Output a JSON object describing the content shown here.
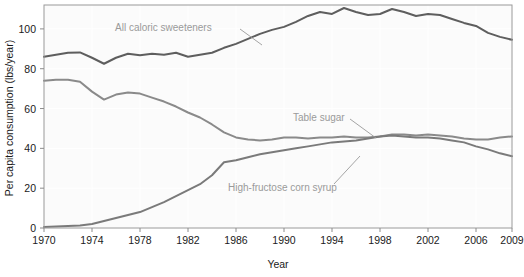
{
  "chart_data": {
    "type": "line",
    "title": "",
    "xlabel": "Year",
    "ylabel": "Per capita consumption (lbs/year)",
    "xlim": [
      1970,
      2009
    ],
    "ylim": [
      0,
      112
    ],
    "grid": true,
    "legend_position": "inline-annotations",
    "xticks": [
      1970,
      1974,
      1978,
      1982,
      1986,
      1990,
      1994,
      1998,
      2002,
      2006,
      2009
    ],
    "xtick_labels": [
      "1970",
      "1974",
      "1978",
      "1982",
      "1986",
      "1990",
      "1994",
      "1998",
      "2002",
      "2006",
      "2009"
    ],
    "yticks": [
      0,
      20,
      40,
      60,
      80,
      100
    ],
    "ytick_labels": [
      "0",
      "20",
      "40",
      "60",
      "80",
      "100"
    ],
    "x": [
      1970,
      1971,
      1972,
      1973,
      1974,
      1975,
      1976,
      1977,
      1978,
      1979,
      1980,
      1981,
      1982,
      1983,
      1984,
      1985,
      1986,
      1987,
      1988,
      1989,
      1990,
      1991,
      1992,
      1993,
      1994,
      1995,
      1996,
      1997,
      1998,
      1999,
      2000,
      2001,
      2002,
      2003,
      2004,
      2005,
      2006,
      2007,
      2008,
      2009
    ],
    "series": [
      {
        "name": "All caloric sweeteners",
        "color": "#5e5e5e",
        "width": 2.0,
        "values": [
          86.0,
          87.0,
          88.0,
          88.2,
          85.5,
          82.5,
          85.5,
          87.5,
          86.8,
          87.5,
          87.0,
          88.0,
          86.0,
          87.0,
          88.0,
          90.5,
          92.5,
          95.0,
          97.5,
          99.5,
          101.0,
          103.5,
          106.5,
          108.5,
          107.5,
          110.5,
          108.5,
          107.0,
          107.5,
          110.0,
          108.5,
          106.5,
          107.5,
          107.0,
          105.0,
          103.0,
          101.5,
          98.0,
          96.0,
          94.5
        ]
      },
      {
        "name": "Table sugar",
        "color": "#8a8a8a",
        "width": 2.0,
        "values": [
          74.0,
          74.5,
          74.5,
          73.5,
          68.5,
          64.5,
          67.0,
          68.0,
          67.5,
          65.5,
          63.5,
          61.0,
          58.0,
          55.5,
          52.0,
          48.0,
          45.5,
          44.5,
          44.0,
          44.5,
          45.5,
          45.5,
          45.0,
          45.5,
          45.5,
          46.0,
          45.5,
          45.5,
          46.0,
          47.0,
          47.0,
          46.5,
          47.0,
          46.5,
          46.0,
          45.0,
          44.5,
          44.5,
          45.5,
          46.0
        ]
      },
      {
        "name": "High-fructose corn syrup",
        "color": "#7a7a7a",
        "width": 2.0,
        "values": [
          0.5,
          0.8,
          1.0,
          1.3,
          2.0,
          3.5,
          5.0,
          6.5,
          8.0,
          10.5,
          13.0,
          16.0,
          19.0,
          22.0,
          26.5,
          33.0,
          34.0,
          35.5,
          37.0,
          38.0,
          39.0,
          40.0,
          41.0,
          42.0,
          43.0,
          43.5,
          44.0,
          45.0,
          46.0,
          46.5,
          46.0,
          45.5,
          45.5,
          45.0,
          44.0,
          43.0,
          41.0,
          39.5,
          37.5,
          36.0
        ]
      }
    ],
    "annotations": [
      {
        "name": "all-caloric-sweeteners-label",
        "text": "All caloric sweeteners",
        "x": 115,
        "y": 31,
        "leader": {
          "x1": 240,
          "y1": 29,
          "x2": 262,
          "y2": 45
        }
      },
      {
        "name": "table-sugar-label",
        "text": "Table sugar",
        "x": 293,
        "y": 121,
        "leader": {
          "x1": 350,
          "y1": 119,
          "x2": 376,
          "y2": 138
        }
      },
      {
        "name": "high-fructose-corn-syrup-label",
        "text": "High-fructose corn syrup",
        "x": 228,
        "y": 191,
        "leader": {
          "x1": 334,
          "y1": 184,
          "x2": 360,
          "y2": 156
        }
      }
    ],
    "colors": {
      "plot_background": "#fbfbfb",
      "grid": "#ffffff",
      "axis": "#8c8c8c",
      "text": "#1a1a1a",
      "annotation_text": "#9a9a9a"
    }
  }
}
